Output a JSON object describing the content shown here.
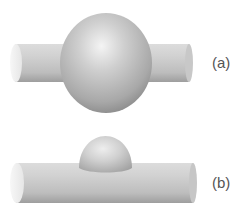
{
  "figure": {
    "panels": [
      {
        "id": "a",
        "label": "(a)",
        "description": "Sphere on cylinder (large droplet engulfing fiber)"
      },
      {
        "id": "b",
        "label": "(b)",
        "description": "Spherical cap on cylinder (small droplet sitting on fiber)"
      }
    ],
    "colors": {
      "background": "#ffffff",
      "shape_light": "#f2f2f2",
      "shape_mid": "#c4c4c4",
      "shape_dark": "#8e8e8e",
      "label": "#555555"
    }
  }
}
